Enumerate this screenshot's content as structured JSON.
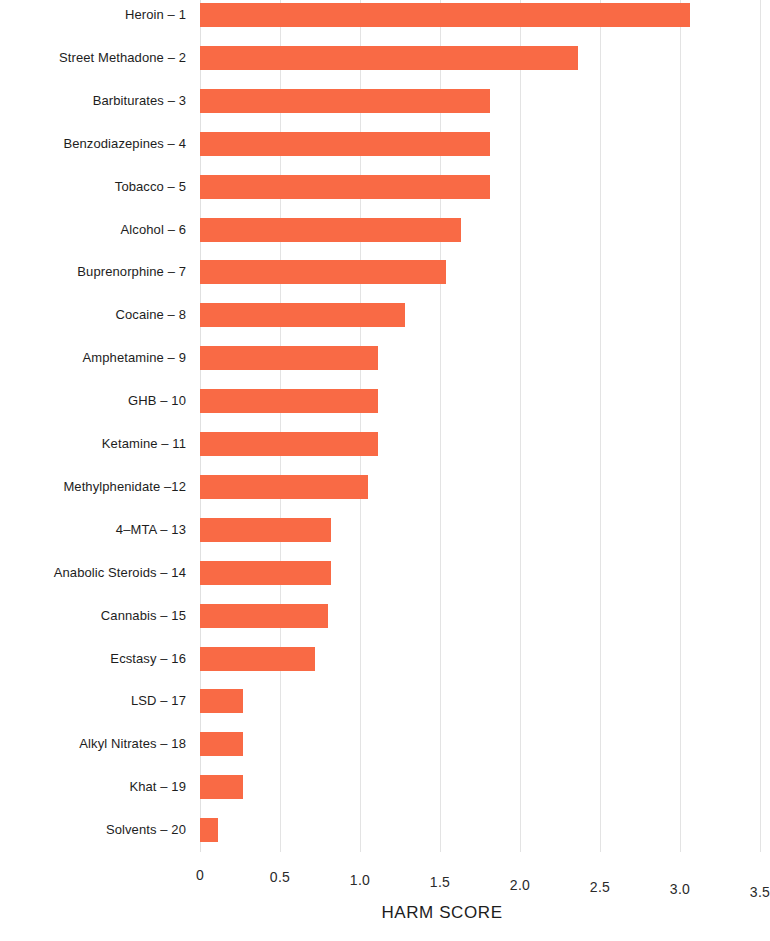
{
  "chart_data": {
    "type": "bar",
    "orientation": "horizontal",
    "title": "",
    "subtitle": "",
    "xlabel": "HARM SCORE",
    "ylabel": "",
    "xlim": [
      0,
      3.5
    ],
    "xticks": [
      "0",
      "0.5",
      "1.0",
      "1.5",
      "2.0",
      "2.5",
      "3.0",
      "3.5"
    ],
    "xtick_values": [
      0,
      0.5,
      1.0,
      1.5,
      2.0,
      2.5,
      3.0,
      3.5
    ],
    "grid": "vertical",
    "legend": "none",
    "bar_color": "#f96a45",
    "grid_color": "#e3e3e3",
    "background": "#ffffff",
    "categories": [
      "Heroin – 1",
      "Street Methadone – 2",
      "Barbiturates – 3",
      "Benzodiazepines – 4",
      "Tobacco – 5",
      "Alcohol – 6",
      "Buprenorphine – 7",
      "Cocaine – 8",
      "Amphetamine – 9",
      "GHB – 10",
      "Ketamine – 11",
      "Methylphenidate –12",
      "4–MTA – 13",
      "Anabolic Steroids – 14",
      "Cannabis – 15",
      "Ecstasy – 16",
      "LSD – 17",
      "Alkyl Nitrates – 18",
      "Khat – 19",
      "Solvents – 20"
    ],
    "values": [
      3.06,
      2.36,
      1.81,
      1.81,
      1.81,
      1.63,
      1.54,
      1.28,
      1.11,
      1.11,
      1.11,
      1.05,
      0.82,
      0.82,
      0.8,
      0.72,
      0.27,
      0.27,
      0.27,
      0.11
    ]
  }
}
